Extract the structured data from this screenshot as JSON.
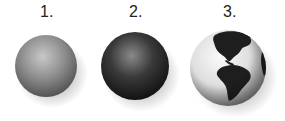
{
  "figure": {
    "items": [
      {
        "label": "1.",
        "description": "gray shaded sphere"
      },
      {
        "label": "2.",
        "description": "dark shaded sphere"
      },
      {
        "label": "3.",
        "description": "globe showing the Americas"
      }
    ]
  },
  "colors": {
    "background": "#ffffff",
    "sphere1": "#8a8a8a",
    "sphere2": "#2a2a2a",
    "globe_ocean": "#e4e4e4",
    "globe_land": "#1e1e1e"
  }
}
